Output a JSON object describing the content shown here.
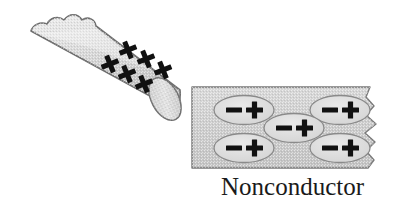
{
  "figure": {
    "background_color": "#ffffff",
    "width": 408,
    "height": 210
  },
  "rod": {
    "name": "charged-rod",
    "description": "cylindrical rod tilted diagonally, torn left end, rounded right cap",
    "fill_color": "#d8d8d8",
    "outline_color": "#6b6b6b",
    "angle_degrees": -28,
    "charge_sign": "+",
    "charge_count": 6,
    "charges": [
      {
        "label": "+",
        "x": 128,
        "y": 50
      },
      {
        "label": "+",
        "x": 146,
        "y": 58
      },
      {
        "label": "+",
        "x": 162,
        "y": 68
      },
      {
        "label": "+",
        "x": 110,
        "y": 62
      },
      {
        "label": "+",
        "x": 126,
        "y": 71
      },
      {
        "label": "+",
        "x": 142,
        "y": 80
      }
    ]
  },
  "nonconductor": {
    "name": "nonconductor-block",
    "label": "Nonconductor",
    "fill_color": "#cfcfcf",
    "outline_color": "#777777",
    "left": 192,
    "top": 87,
    "width": 190,
    "height": 81,
    "molecules": [
      {
        "name": "molecule-top-left",
        "negative": "−",
        "positive": "+",
        "cx": 244,
        "cy": 110
      },
      {
        "name": "molecule-top-right",
        "negative": "−",
        "positive": "+",
        "cx": 340,
        "cy": 110
      },
      {
        "name": "molecule-center",
        "negative": "−",
        "positive": "+",
        "cx": 294,
        "cy": 128
      },
      {
        "name": "molecule-bottom-left",
        "negative": "−",
        "positive": "+",
        "cx": 244,
        "cy": 148
      },
      {
        "name": "molecule-bottom-right",
        "negative": "−",
        "positive": "+",
        "cx": 340,
        "cy": 148
      }
    ],
    "molecule_fill_color": "#dedede",
    "molecule_outline_color": "#8a8a8a"
  },
  "colors": {
    "charge_glyph": "#111111",
    "label_text": "#1a1a1a"
  }
}
